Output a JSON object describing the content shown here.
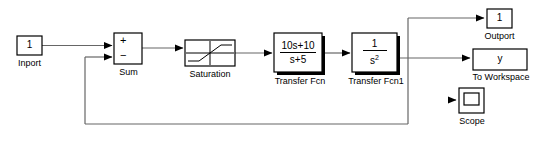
{
  "diagram": {
    "line_color": "#555555",
    "block_border_color": "#000000",
    "block_fill": "#ffffff",
    "shadow_color": "#000000",
    "background": "#ffffff"
  },
  "blocks": {
    "inport": {
      "name": "Inport",
      "value": "1",
      "label": "Inport"
    },
    "sum": {
      "name": "Sum",
      "label": "Sum",
      "plus": "+",
      "minus": "−"
    },
    "saturation": {
      "name": "Saturation",
      "label": "Saturation"
    },
    "transfer_fcn": {
      "name": "Transfer Fcn",
      "label": "Transfer Fcn",
      "numerator": "10s+10",
      "denominator": "s+5"
    },
    "transfer_fcn1": {
      "name": "Transfer Fcn1",
      "label": "Transfer Fcn1",
      "numerator": "1",
      "denominator_base": "s",
      "denominator_exp": "2"
    },
    "outport": {
      "name": "Outport",
      "value": "1",
      "label": "Outport"
    },
    "to_workspace": {
      "name": "To Workspace",
      "value": "y",
      "label": "To Workspace"
    },
    "scope": {
      "name": "Scope",
      "label": "Scope"
    }
  },
  "signals": {
    "inport_to_sum": "Inport output to Sum plus input",
    "sum_to_saturation": "Sum output to Saturation input",
    "saturation_to_tf": "Saturation output to Transfer Fcn input",
    "tf_to_tf1": "Transfer Fcn output to Transfer Fcn1 input",
    "tf1_to_branch": "Transfer Fcn1 output to branch point",
    "branch_to_outport": "Branch up to Outport",
    "branch_to_workspace": "Branch to To Workspace",
    "feedback": "Feedback from output to Sum minus input"
  }
}
